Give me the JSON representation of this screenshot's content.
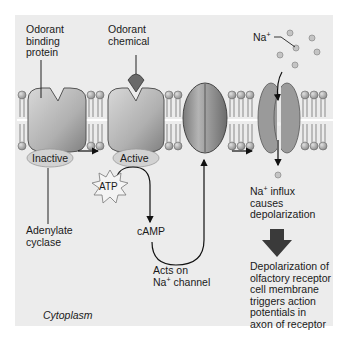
{
  "diagram": {
    "labels": {
      "odorant_binding_protein": [
        "Odorant",
        "binding",
        "protein"
      ],
      "odorant_chemical": [
        "Odorant",
        "chemical"
      ],
      "na_ion": "Na",
      "na_ion_charge": "+",
      "inactive_state": "Inactive",
      "active_state": "Active",
      "atp": "ATP",
      "adenylate_cyclase": [
        "Adenylate",
        "cyclase"
      ],
      "camp": "cAMP",
      "acts_on_line1": "Acts on",
      "acts_on_line2_prefix": "Na",
      "acts_on_line2_charge": "+",
      "acts_on_line2_suffix": " channel",
      "influx_line1_prefix": "Na",
      "influx_line1_charge": "+",
      "influx_line1_suffix": " influx",
      "influx_lines": [
        "causes",
        "depolarization"
      ],
      "result": [
        "Depolarization of",
        "olfactory receptor",
        "cell membrane",
        "triggers action",
        "potentials in",
        "axon of receptor"
      ],
      "cytoplasm": "Cytoplasm"
    },
    "colors": {
      "background": "#ececec",
      "protein": "#b8b8b8",
      "channel_closed": "#8f8f8f",
      "channel_open": "#9a9a9a",
      "odorant": "#6e6e6e",
      "lipid_head": "#a8a8a8",
      "ion": "#c4c4c4",
      "ellipse": "#d2d2d2",
      "big_arrow": "#3a3a3a",
      "text": "#1a1a1a"
    }
  }
}
